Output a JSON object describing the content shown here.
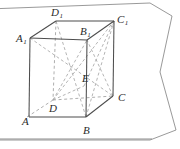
{
  "figure": {
    "kind": "cube-geometry-diagram",
    "background_color": "#ffffff",
    "solid_line_color": "#4a4a4a",
    "dashed_line_color": "#9a9a9a",
    "plane_line_color": "#8a8a8a",
    "label_color": "#2b2b2b",
    "vertices": [
      {
        "name": "A",
        "base": "A",
        "sub": "",
        "label_x": 22,
        "label_y": 125,
        "point_x": 27,
        "point_y": 117
      },
      {
        "name": "B",
        "base": "B",
        "sub": "",
        "label_x": 83,
        "label_y": 134,
        "point_x": 86,
        "point_y": 117
      },
      {
        "name": "C",
        "base": "C",
        "sub": "",
        "label_x": 118,
        "label_y": 101,
        "point_x": 113,
        "point_y": 96
      },
      {
        "name": "D",
        "base": "D",
        "sub": "",
        "label_x": 49,
        "label_y": 112,
        "point_x": 53,
        "point_y": 100
      },
      {
        "name": "A1",
        "base": "A",
        "sub": "1",
        "label_x": 16,
        "label_y": 42,
        "point_x": 30,
        "point_y": 38
      },
      {
        "name": "B1",
        "base": "B",
        "sub": "1",
        "label_x": 80,
        "label_y": 35,
        "point_x": 87,
        "point_y": 40
      },
      {
        "name": "C1",
        "base": "C",
        "sub": "1",
        "label_x": 117,
        "label_y": 23,
        "point_x": 114,
        "point_y": 21
      },
      {
        "name": "D1",
        "base": "D",
        "sub": "1",
        "label_x": 51,
        "label_y": 16,
        "point_x": 56,
        "point_y": 21
      },
      {
        "name": "E",
        "base": "E",
        "sub": "",
        "label_x": 82,
        "label_y": 82,
        "point_x": 84,
        "point_y": 86
      }
    ],
    "solid_edges": [
      "A1-D1",
      "D1-C1",
      "A1-B1v",
      "B1v-C1",
      "A1-A",
      "B1v-B",
      "C1-C",
      "A-B",
      "B-C"
    ],
    "dashed_edges": [
      "A1-D1-hidden-drop",
      "D1-D",
      "D-A",
      "D-C"
    ],
    "dashed_diagonals": [
      "D-B1",
      "D-C1",
      "A1-C",
      "B1-D",
      "D-E",
      "E-C1",
      "B-D1",
      "C1-B"
    ],
    "plane_outline": "sheet with slanted top edge, near-horizontal bottom edge and a zig-zag right border"
  }
}
